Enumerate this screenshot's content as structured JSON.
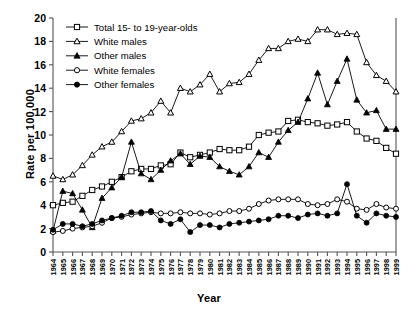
{
  "chart_data": {
    "type": "line",
    "title": "",
    "xlabel": "Year",
    "ylabel": "Rate per 100,000",
    "ylim": [
      0,
      20
    ],
    "ytick_step": 2,
    "yticks": [
      0,
      2,
      4,
      6,
      8,
      10,
      12,
      14,
      16,
      18,
      20
    ],
    "grid": false,
    "legend_position": "top-left",
    "x": [
      1964,
      1965,
      1966,
      1967,
      1968,
      1969,
      1970,
      1971,
      1972,
      1973,
      1974,
      1975,
      1976,
      1977,
      1978,
      1979,
      1980,
      1981,
      1982,
      1983,
      1984,
      1985,
      1986,
      1987,
      1988,
      1989,
      1990,
      1991,
      1992,
      1993,
      1994,
      1995,
      1996,
      1997,
      1998,
      1999
    ],
    "categories": [
      "1964",
      "1965",
      "1966",
      "1967",
      "1968",
      "1969",
      "1970",
      "1971",
      "1972",
      "1973",
      "1974",
      "1975",
      "1976",
      "1977",
      "1978",
      "1979",
      "1980",
      "1981",
      "1982",
      "1983",
      "1984",
      "1985",
      "1986",
      "1987",
      "1988",
      "1989",
      "1990",
      "1991",
      "1992",
      "1993",
      "1994",
      "1995",
      "1996",
      "1997",
      "1998",
      "1999"
    ],
    "series": [
      {
        "name": "Total 15- to 19-year-olds",
        "marker": "open-square",
        "values": [
          4.0,
          4.2,
          4.3,
          4.8,
          5.3,
          5.6,
          6.0,
          6.4,
          6.9,
          7.1,
          7.1,
          7.4,
          7.5,
          8.5,
          8.1,
          8.3,
          8.5,
          8.8,
          8.7,
          8.7,
          9.0,
          10.0,
          10.2,
          10.3,
          11.2,
          11.3,
          11.1,
          11.0,
          10.8,
          10.9,
          11.1,
          10.3,
          9.7,
          9.5,
          8.9,
          8.4
        ]
      },
      {
        "name": "White males",
        "marker": "open-triangle",
        "values": [
          6.5,
          6.2,
          6.6,
          7.4,
          8.3,
          9.0,
          9.4,
          10.3,
          11.2,
          11.4,
          11.9,
          12.9,
          11.9,
          14.0,
          13.7,
          14.3,
          15.2,
          13.7,
          14.4,
          14.5,
          15.2,
          16.4,
          17.4,
          17.4,
          18.0,
          18.2,
          18.0,
          19.0,
          19.0,
          18.6,
          18.7,
          18.6,
          16.2,
          15.1,
          14.6,
          13.7
        ]
      },
      {
        "name": "Other males",
        "marker": "filled-triangle",
        "values": [
          1.8,
          5.2,
          5.0,
          3.6,
          2.1,
          4.6,
          5.5,
          6.4,
          9.4,
          6.7,
          6.2,
          7.0,
          7.8,
          8.4,
          7.5,
          8.2,
          8.1,
          7.3,
          6.9,
          6.6,
          7.3,
          8.5,
          8.1,
          9.4,
          10.4,
          11.1,
          13.1,
          15.3,
          12.6,
          14.6,
          16.5,
          13.0,
          11.9,
          12.1,
          10.5,
          10.5
        ]
      },
      {
        "name": "White females",
        "marker": "open-circle",
        "values": [
          1.7,
          1.8,
          2.0,
          2.1,
          2.2,
          2.5,
          2.9,
          3.0,
          3.2,
          3.3,
          3.4,
          3.3,
          3.3,
          3.4,
          3.3,
          3.3,
          3.2,
          3.3,
          3.5,
          3.5,
          3.7,
          4.1,
          4.4,
          4.5,
          4.5,
          4.5,
          4.1,
          4.0,
          4.1,
          4.5,
          4.3,
          3.7,
          3.6,
          4.1,
          3.8,
          3.7
        ]
      },
      {
        "name": "Other females",
        "marker": "filled-circle",
        "values": [
          1.9,
          2.4,
          2.4,
          2.2,
          2.4,
          2.7,
          2.9,
          3.1,
          3.4,
          3.4,
          3.5,
          2.7,
          2.4,
          2.8,
          1.7,
          2.3,
          2.3,
          2.1,
          2.4,
          2.5,
          2.6,
          2.7,
          2.8,
          3.1,
          3.1,
          2.9,
          3.2,
          3.3,
          3.1,
          3.3,
          5.8,
          3.1,
          2.5,
          3.3,
          3.1,
          3.0
        ]
      }
    ],
    "legend": [
      {
        "label": "Total 15- to 19-year-olds",
        "marker": "open-square"
      },
      {
        "label": "White males",
        "marker": "open-triangle"
      },
      {
        "label": "Other males",
        "marker": "filled-triangle"
      },
      {
        "label": "White females",
        "marker": "open-circle"
      },
      {
        "label": "Other females",
        "marker": "filled-circle"
      }
    ],
    "colors": {
      "line": "#000000",
      "fill_open": "#ffffff",
      "fill_closed": "#000000",
      "axis": "#555555",
      "background": "#ffffff"
    }
  }
}
